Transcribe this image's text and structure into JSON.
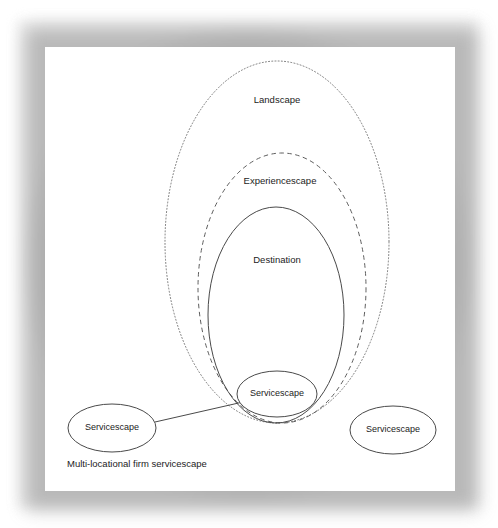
{
  "page": {
    "background_color": "#ffffff",
    "canvas_color": "#ffffff",
    "frame_color": "#9a9a9a"
  },
  "diagram": {
    "type": "nested-ellipse-venn",
    "stroke_color": "#555555",
    "text_color": "#1c1c1c",
    "shapes": [
      {
        "id": "landscape-ellipse",
        "label": "Landscape",
        "line_style": "dotted",
        "cx": 277,
        "cy": 242,
        "rx": 112,
        "ry": 181,
        "label_x": 277,
        "label_y": 100
      },
      {
        "id": "experiencescape-ellipse",
        "label": "Experiencescape",
        "line_style": "dashed",
        "cx": 282,
        "cy": 288,
        "rx": 84,
        "ry": 135,
        "label_x": 280,
        "label_y": 181
      },
      {
        "id": "destination-ellipse",
        "label": "Destination",
        "line_style": "solid",
        "cx": 276,
        "cy": 315,
        "rx": 68,
        "ry": 108,
        "label_x": 277,
        "label_y": 260
      },
      {
        "id": "servicescape-inner-ellipse",
        "label": "Servicescape",
        "line_style": "solid",
        "cx": 277,
        "cy": 394,
        "rx": 40,
        "ry": 23,
        "label_x": 277,
        "label_y": 394
      },
      {
        "id": "servicescape-left-ellipse",
        "label": "Servicescape",
        "line_style": "solid",
        "cx": 112,
        "cy": 428,
        "rx": 44,
        "ry": 24,
        "label_x": 112,
        "label_y": 428
      },
      {
        "id": "servicescape-right-ellipse",
        "label": "Servicescape",
        "line_style": "solid",
        "cx": 393,
        "cy": 430,
        "rx": 43,
        "ry": 24,
        "label_x": 393,
        "label_y": 430
      }
    ],
    "connector": {
      "id": "multi-location-connector",
      "from_shape": "servicescape-left-ellipse",
      "to_shape": "servicescape-inner-ellipse",
      "x1": 155,
      "y1": 422,
      "x2": 243,
      "y2": 402
    },
    "caption": {
      "text": "Multi-locational firm servicescape",
      "x": 67,
      "y": 464
    }
  }
}
